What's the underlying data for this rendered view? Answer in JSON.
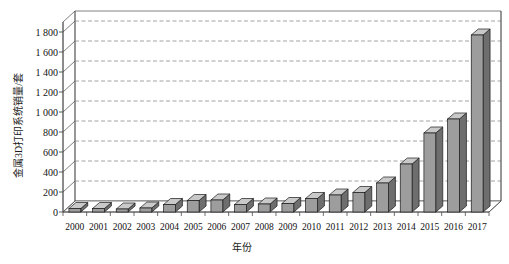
{
  "chart_data": {
    "type": "bar",
    "title": "",
    "xlabel": "年份",
    "ylabel": "金属3D打印系统销量/套",
    "categories": [
      "2000",
      "2001",
      "2002",
      "2003",
      "2004",
      "2005",
      "2006",
      "2007",
      "2008",
      "2009",
      "2010",
      "2011",
      "2012",
      "2013",
      "2014",
      "2015",
      "2016",
      "2017"
    ],
    "values": [
      35,
      35,
      30,
      40,
      75,
      115,
      120,
      75,
      80,
      85,
      135,
      170,
      195,
      290,
      480,
      790,
      930,
      1770
    ],
    "series": [
      {
        "name": "金属3D打印系统销量",
        "values": [
          35,
          35,
          30,
          40,
          75,
          115,
          120,
          75,
          80,
          85,
          135,
          170,
          195,
          290,
          480,
          790,
          930,
          1770
        ]
      }
    ],
    "ylim": [
      0,
      1900
    ],
    "ytick_values": [
      0,
      200,
      400,
      600,
      800,
      1000,
      1200,
      1400,
      1600,
      1800
    ],
    "ytick_labels": [
      "0",
      "200",
      "400",
      "600",
      "800",
      "1 000",
      "1 200",
      "1 400",
      "1 600",
      "1 800"
    ],
    "grid": true,
    "grid_axis": "y",
    "grid_style": "dashed",
    "legend": false,
    "legend_position": "none",
    "style_3d": true,
    "bar_color": "#9d9d9d",
    "bar_top_color": "#c9c9c9",
    "bar_side_color": "#6e6e6e",
    "bar_edge_color": "#1a1a1a",
    "axis_color": "#4a4a4a",
    "grid_color": "#8a8a8a",
    "background_color": "#ffffff",
    "text_color": "#111111"
  },
  "axis": {
    "y_title": "金属3D打印系统销量/套",
    "x_title": "年份"
  }
}
